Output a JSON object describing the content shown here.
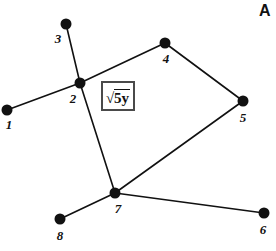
{
  "figure": {
    "corner_letter": "A",
    "background_color": "#ffffff",
    "node_color": "#111111",
    "edge_color": "#111111"
  },
  "expression_box": {
    "radical_sign": "√",
    "radicand": "5y",
    "full_text": "√5y",
    "border_color": "#4a4a4a"
  },
  "chart_data": {
    "type": "diagram",
    "subtype": "node-link-graph",
    "title": "",
    "nodes": [
      {
        "label": "1",
        "x": 7,
        "y": 110,
        "label_x": 9,
        "label_y": 124
      },
      {
        "label": "2",
        "x": 80,
        "y": 83,
        "label_x": 73,
        "label_y": 98
      },
      {
        "label": "3",
        "x": 66,
        "y": 24,
        "label_x": 58,
        "label_y": 38
      },
      {
        "label": "4",
        "x": 165,
        "y": 43,
        "label_x": 166,
        "label_y": 58
      },
      {
        "label": "5",
        "x": 243,
        "y": 101,
        "label_x": 243,
        "label_y": 117
      },
      {
        "label": "6",
        "x": 264,
        "y": 213,
        "label_x": 263,
        "label_y": 229
      },
      {
        "label": "7",
        "x": 115,
        "y": 193,
        "label_x": 118,
        "label_y": 208
      },
      {
        "label": "8",
        "x": 60,
        "y": 219,
        "label_x": 60,
        "label_y": 235
      }
    ],
    "edges": [
      {
        "from": "1",
        "to": "2"
      },
      {
        "from": "3",
        "to": "2"
      },
      {
        "from": "2",
        "to": "4"
      },
      {
        "from": "2",
        "to": "7"
      },
      {
        "from": "4",
        "to": "5"
      },
      {
        "from": "5",
        "to": "7"
      },
      {
        "from": "7",
        "to": "8"
      },
      {
        "from": "7",
        "to": "6"
      }
    ],
    "node_radius": 5.5,
    "edge_width": 1.6,
    "annotations": [
      {
        "text": "√5y",
        "boxed": true,
        "x": 118,
        "y": 96
      },
      {
        "text": "A",
        "boxed": false,
        "x": 263,
        "y": 11
      }
    ]
  }
}
